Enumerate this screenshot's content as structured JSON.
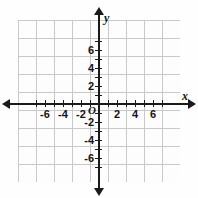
{
  "figure": {
    "type": "cartesian-coordinate-grid",
    "title": "",
    "background_color": "#fefefe",
    "grid_color": "#c9c9c9",
    "grid_minor_color": "#dcdcdc",
    "axis_color": "#1a1a1a",
    "label_color": "#141414"
  },
  "axes": {
    "x": {
      "letter": "x",
      "min": -7,
      "max": 7,
      "tick_step": 1,
      "labeled_step": 2,
      "labels": [
        "-6",
        "-4",
        "-2",
        "2",
        "4",
        "6"
      ],
      "label_values": [
        -6,
        -4,
        -2,
        2,
        4,
        6
      ]
    },
    "y": {
      "letter": "y",
      "min": -7,
      "max": 7,
      "tick_step": 1,
      "labeled_step": 2,
      "labels": [
        "6",
        "4",
        "2",
        "-2",
        "-4",
        "-6"
      ],
      "label_values": [
        6,
        4,
        2,
        -2,
        -4,
        -6
      ]
    },
    "origin_label": "O"
  },
  "chart_data": {
    "type": "scatter",
    "title": "",
    "xlabel": "x",
    "ylabel": "y",
    "xlim": [
      -7,
      7
    ],
    "ylim": [
      -7,
      7
    ],
    "xticks": [
      -6,
      -4,
      -2,
      0,
      2,
      4,
      6
    ],
    "yticks": [
      -6,
      -4,
      -2,
      0,
      2,
      4,
      6
    ],
    "grid": true,
    "legend": null,
    "series": [],
    "x": [],
    "y": [],
    "annotations": [
      "O"
    ]
  }
}
